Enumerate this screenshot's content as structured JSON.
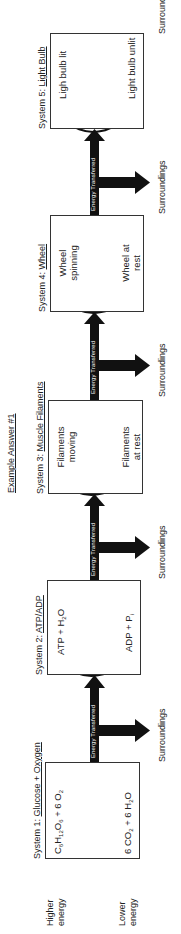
{
  "header": "Example Answer #1",
  "energy_labels": {
    "higher": [
      "Higher",
      "energy"
    ],
    "lower": [
      "Lower",
      "energy"
    ]
  },
  "transfer_label": "Energy Transferred",
  "surroundings_label": "Surroundings",
  "colors": {
    "arrow": "#111111",
    "box_border": "#333333",
    "text": "#222222"
  },
  "systems": [
    {
      "prefix": "System 1:",
      "name": "Glucose + Oxygen",
      "high_state": "C6H12O6 + 6 O2",
      "low_state": "6 CO2 + 6 H2O",
      "cycle": "one-way"
    },
    {
      "prefix": "System 2:",
      "name": "ATP/ADP",
      "high_state": "ATP + H2O",
      "low_state": "ADP + Pi",
      "cycle": "two-way"
    },
    {
      "prefix": "System 3:",
      "name": "Muscle Filaments",
      "high_state": "Filaments moving",
      "low_state": "Filaments at rest",
      "cycle": "two-way"
    },
    {
      "prefix": "System 4:",
      "name": "Wheel",
      "high_state": "Wheel spinning",
      "low_state": "Wheel at rest",
      "cycle": "two-way"
    },
    {
      "prefix": "System 5:",
      "name": "Light Bulb",
      "high_state": "Ligh bulb lit",
      "low_state": "Light bulb unlit",
      "cycle": "one-way-reverse"
    }
  ]
}
